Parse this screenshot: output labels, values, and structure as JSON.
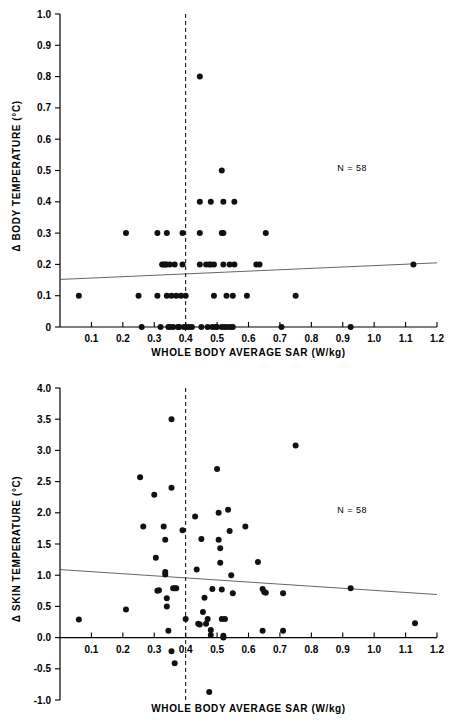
{
  "figure": {
    "background": "#ffffff",
    "marker_color": "#111111",
    "axis_color": "#000000",
    "fit_line_color": "#555555"
  },
  "chart_data": [
    {
      "id": "body-temperature-scatter",
      "type": "scatter",
      "title": "",
      "xlabel": "WHOLE BODY AVERAGE SAR (W/kg)",
      "ylabel": "Δ BODY TEMPERATURE (°C)",
      "ylabel_symbol": "Δ",
      "ylabel_text": "BODY TEMPERATURE (°C)",
      "xlim": [
        0.0,
        1.2
      ],
      "ylim": [
        0.0,
        1.0
      ],
      "xticks": [
        0.1,
        0.2,
        0.3,
        0.4,
        0.5,
        0.6,
        0.7,
        0.8,
        0.9,
        1.0,
        1.1,
        1.2
      ],
      "xticklabels": [
        "0.1",
        "0.2",
        "0.3",
        "0.4",
        "0.5",
        "0.6",
        "0.7",
        "0.8",
        "0.9",
        "1.0",
        "1.1",
        "1.2"
      ],
      "yticks": [
        0.0,
        0.1,
        0.2,
        0.3,
        0.4,
        0.5,
        0.6,
        0.7,
        0.8,
        0.9,
        1.0
      ],
      "yticklabels": [
        "0",
        "0.1",
        "0.2",
        "0.3",
        "0.4",
        "0.5",
        "0.6",
        "0.7",
        "0.8",
        "0.9",
        "1.0"
      ],
      "grid": false,
      "legend": false,
      "annotation": "N = 58",
      "annotation_x": 0.93,
      "annotation_y": 0.5,
      "reference_line": {
        "orientation": "vertical",
        "x": 0.4,
        "style": "dashed"
      },
      "fit_line": {
        "x": [
          0.0,
          1.2
        ],
        "y": [
          0.152,
          0.205
        ],
        "style": "solid"
      },
      "points": [
        [
          0.06,
          0.1
        ],
        [
          0.21,
          0.3
        ],
        [
          0.25,
          0.1
        ],
        [
          0.26,
          0.0
        ],
        [
          0.31,
          0.3
        ],
        [
          0.31,
          0.1
        ],
        [
          0.32,
          0.0
        ],
        [
          0.325,
          0.2
        ],
        [
          0.33,
          0.2
        ],
        [
          0.335,
          0.2
        ],
        [
          0.34,
          0.3
        ],
        [
          0.34,
          0.2
        ],
        [
          0.34,
          0.1
        ],
        [
          0.345,
          0.0
        ],
        [
          0.35,
          0.2
        ],
        [
          0.35,
          0.0
        ],
        [
          0.355,
          0.1
        ],
        [
          0.36,
          0.0
        ],
        [
          0.365,
          0.2
        ],
        [
          0.37,
          0.1
        ],
        [
          0.375,
          0.0
        ],
        [
          0.38,
          0.0
        ],
        [
          0.385,
          0.1
        ],
        [
          0.39,
          0.3
        ],
        [
          0.39,
          0.2
        ],
        [
          0.395,
          0.0
        ],
        [
          0.4,
          0.1
        ],
        [
          0.4,
          0.0
        ],
        [
          0.41,
          0.0
        ],
        [
          0.42,
          0.0
        ],
        [
          0.445,
          0.8
        ],
        [
          0.445,
          0.4
        ],
        [
          0.445,
          0.3
        ],
        [
          0.445,
          0.2
        ],
        [
          0.45,
          0.0
        ],
        [
          0.465,
          0.2
        ],
        [
          0.47,
          0.0
        ],
        [
          0.475,
          0.2
        ],
        [
          0.48,
          0.4
        ],
        [
          0.48,
          0.2
        ],
        [
          0.485,
          0.0
        ],
        [
          0.49,
          0.2
        ],
        [
          0.49,
          0.1
        ],
        [
          0.495,
          0.0
        ],
        [
          0.5,
          0.0
        ],
        [
          0.515,
          0.5
        ],
        [
          0.515,
          0.3
        ],
        [
          0.515,
          0.0
        ],
        [
          0.52,
          0.4
        ],
        [
          0.52,
          0.3
        ],
        [
          0.52,
          0.2
        ],
        [
          0.525,
          0.0
        ],
        [
          0.53,
          0.1
        ],
        [
          0.535,
          0.0
        ],
        [
          0.54,
          0.2
        ],
        [
          0.545,
          0.0
        ],
        [
          0.55,
          0.1
        ],
        [
          0.55,
          0.0
        ],
        [
          0.555,
          0.4
        ],
        [
          0.555,
          0.2
        ],
        [
          0.595,
          0.1
        ],
        [
          0.625,
          0.2
        ],
        [
          0.635,
          0.2
        ],
        [
          0.655,
          0.3
        ],
        [
          0.705,
          0.0
        ],
        [
          0.75,
          0.1
        ],
        [
          0.925,
          0.0
        ],
        [
          1.125,
          0.2
        ]
      ]
    },
    {
      "id": "skin-temperature-scatter",
      "type": "scatter",
      "title": "",
      "xlabel": "WHOLE BODY AVERAGE SAR (W/kg)",
      "ylabel": "Δ SKIN TEMPERATURE (°C)",
      "ylabel_symbol": "Δ",
      "ylabel_text": "SKIN TEMPERATURE (°C)",
      "xlim": [
        0.0,
        1.2
      ],
      "ylim": [
        -1.0,
        4.0
      ],
      "xticks": [
        0.1,
        0.2,
        0.3,
        0.4,
        0.5,
        0.6,
        0.7,
        0.8,
        0.9,
        1.0,
        1.1,
        1.2
      ],
      "xticklabels": [
        "0.1",
        "0.2",
        "0.3",
        "0.4",
        "0.5",
        "0.6",
        "0.7",
        "0.8",
        "0.9",
        "1.0",
        "1.1",
        "1.2"
      ],
      "yticks": [
        -1.0,
        -0.5,
        0.0,
        0.5,
        1.0,
        1.5,
        2.0,
        2.5,
        3.0,
        3.5,
        4.0
      ],
      "yticklabels": [
        "-1.0",
        "-0.5",
        "0.0",
        "0.5",
        "1.0",
        "1.5",
        "2.0",
        "2.5",
        "3.0",
        "3.5",
        "4.0"
      ],
      "grid": false,
      "legend": false,
      "annotation": "N = 58",
      "annotation_x": 0.93,
      "annotation_y": 2.0,
      "reference_line": {
        "orientation": "vertical",
        "x": 0.4,
        "style": "dashed"
      },
      "fit_line": {
        "x": [
          0.0,
          1.2
        ],
        "y": [
          1.09,
          0.69
        ],
        "style": "solid"
      },
      "points": [
        [
          0.06,
          0.29
        ],
        [
          0.21,
          0.45
        ],
        [
          0.255,
          2.57
        ],
        [
          0.265,
          1.78
        ],
        [
          0.3,
          2.29
        ],
        [
          0.305,
          1.28
        ],
        [
          0.31,
          0.75
        ],
        [
          0.315,
          0.76
        ],
        [
          0.33,
          1.78
        ],
        [
          0.335,
          1.57
        ],
        [
          0.335,
          1.01
        ],
        [
          0.335,
          1.05
        ],
        [
          0.34,
          0.63
        ],
        [
          0.34,
          0.5
        ],
        [
          0.345,
          0.11
        ],
        [
          0.355,
          3.5
        ],
        [
          0.355,
          2.4
        ],
        [
          0.355,
          -0.22
        ],
        [
          0.36,
          0.79
        ],
        [
          0.365,
          0.79
        ],
        [
          0.37,
          0.79
        ],
        [
          0.365,
          -0.41
        ],
        [
          0.39,
          1.72
        ],
        [
          0.4,
          0.3
        ],
        [
          0.43,
          1.94
        ],
        [
          0.435,
          1.09
        ],
        [
          0.44,
          0.22
        ],
        [
          0.445,
          0.21
        ],
        [
          0.45,
          1.58
        ],
        [
          0.455,
          0.41
        ],
        [
          0.46,
          0.64
        ],
        [
          0.465,
          0.22
        ],
        [
          0.47,
          0.3
        ],
        [
          0.475,
          -0.87
        ],
        [
          0.48,
          0.04
        ],
        [
          0.48,
          0.12
        ],
        [
          0.485,
          0.78
        ],
        [
          0.5,
          2.7
        ],
        [
          0.505,
          2.0
        ],
        [
          0.505,
          1.57
        ],
        [
          0.51,
          1.43
        ],
        [
          0.51,
          1.2
        ],
        [
          0.515,
          0.77
        ],
        [
          0.515,
          0.3
        ],
        [
          0.52,
          0.0
        ],
        [
          0.52,
          0.03
        ],
        [
          0.525,
          0.3
        ],
        [
          0.535,
          2.05
        ],
        [
          0.54,
          1.71
        ],
        [
          0.545,
          1.0
        ],
        [
          0.55,
          0.71
        ],
        [
          0.59,
          1.78
        ],
        [
          0.63,
          1.21
        ],
        [
          0.645,
          0.11
        ],
        [
          0.645,
          0.78
        ],
        [
          0.65,
          0.73
        ],
        [
          0.655,
          0.72
        ],
        [
          0.71,
          0.71
        ],
        [
          0.71,
          0.11
        ],
        [
          0.75,
          3.08
        ],
        [
          0.925,
          0.79
        ],
        [
          1.13,
          0.23
        ]
      ]
    }
  ]
}
